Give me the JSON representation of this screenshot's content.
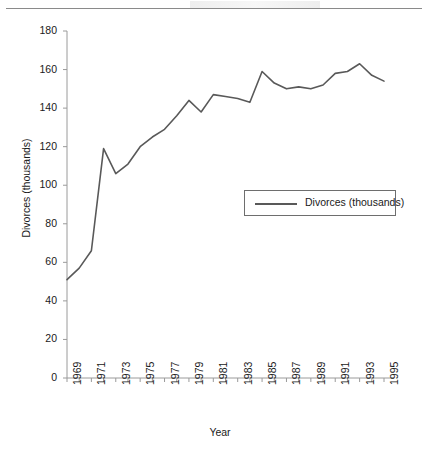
{
  "page": {
    "background_color": "#ffffff",
    "rule_color": "#8a8a8a"
  },
  "chart_data": {
    "type": "line",
    "title": "",
    "xlabel": "Year",
    "ylabel": "Divorces (thousands)",
    "xlim": [
      1969,
      1995
    ],
    "ylim": [
      0,
      180
    ],
    "ytick_step": 20,
    "yticks": [
      0,
      20,
      40,
      60,
      80,
      100,
      120,
      140,
      160,
      180
    ],
    "ytick_labels": [
      "0",
      "20",
      "40",
      "60",
      "80",
      "100",
      "120",
      "140",
      "160",
      "180"
    ],
    "xticks_minor_every": 1,
    "xtick_labels": [
      "1969",
      "1971",
      "1973",
      "1975",
      "1977",
      "1979",
      "1981",
      "1983",
      "1985",
      "1987",
      "1989",
      "1991",
      "1993",
      "1995"
    ],
    "grid": false,
    "legend_position": "center-right",
    "line_color": "#595959",
    "line_width": 1.6,
    "axis_color": "#9a9a9a",
    "categories": [
      1969,
      1970,
      1971,
      1972,
      1973,
      1974,
      1975,
      1976,
      1977,
      1978,
      1979,
      1980,
      1981,
      1982,
      1983,
      1984,
      1985,
      1986,
      1987,
      1988,
      1989,
      1990,
      1991,
      1992,
      1993,
      1994,
      1995
    ],
    "series": [
      {
        "name": "Divorces (thousands)",
        "values": [
          51,
          57,
          66,
          119,
          106,
          111,
          120,
          125,
          129,
          136,
          144,
          138,
          147,
          146,
          145,
          143,
          159,
          153,
          150,
          151,
          150,
          152,
          158,
          159,
          163,
          157,
          154
        ]
      }
    ]
  },
  "legend": {
    "entries": [
      {
        "label": "Divorces (thousands)",
        "color": "#595959"
      }
    ]
  },
  "axes": {
    "x_title": "Year",
    "y_title": "Divorces (thousands)"
  }
}
